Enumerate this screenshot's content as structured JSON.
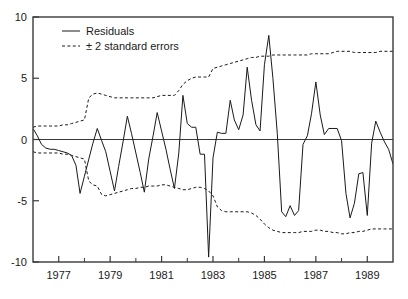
{
  "chart_data": {
    "type": "line",
    "title": "",
    "xlabel": "",
    "ylabel": "",
    "xlim": [
      1976.0,
      1990.0
    ],
    "ylim": [
      -10,
      10
    ],
    "grid": false,
    "legend_position": "top-left",
    "yticks": [
      10,
      5,
      0,
      -5,
      -10
    ],
    "ytick_labels": [
      "10",
      "5",
      "0",
      "-5",
      "-10"
    ],
    "xticks": [
      1977,
      1979,
      1981,
      1983,
      1985,
      1987,
      1989
    ],
    "xtick_labels": [
      "1977",
      "1979",
      "1981",
      "1983",
      "1985",
      "1987",
      "1989"
    ],
    "xminor_ticks": [
      1978,
      1980,
      1982,
      1984,
      1986,
      1988
    ],
    "zero_line": 0,
    "legend": [
      {
        "label": "Residuals",
        "style": "solid",
        "color": "#1a1a1a"
      },
      {
        "label": "± 2 standard errors",
        "style": "dashed",
        "color": "#1a1a1a"
      }
    ],
    "series": [
      {
        "name": "Residuals",
        "style": "solid",
        "color": "#1a1a1a",
        "x": [
          1976.0,
          1976.17,
          1976.33,
          1976.5,
          1976.67,
          1976.83,
          1977.0,
          1977.17,
          1977.33,
          1977.5,
          1977.67,
          1977.83,
          1978.0,
          1978.17,
          1978.33,
          1978.5,
          1978.67,
          1978.83,
          1979.0,
          1979.17,
          1979.33,
          1979.5,
          1979.67,
          1979.83,
          1980.0,
          1980.17,
          1980.33,
          1980.5,
          1980.67,
          1980.83,
          1981.0,
          1981.17,
          1981.33,
          1981.5,
          1981.67,
          1981.83,
          1982.0,
          1982.17,
          1982.33,
          1982.5,
          1982.67,
          1982.83,
          1983.0,
          1983.17,
          1983.33,
          1983.5,
          1983.67,
          1983.83,
          1984.0,
          1984.17,
          1984.33,
          1984.5,
          1984.67,
          1984.83,
          1985.0,
          1985.17,
          1985.33,
          1985.5,
          1985.67,
          1985.83,
          1986.0,
          1986.17,
          1986.33,
          1986.5,
          1986.67,
          1986.83,
          1987.0,
          1987.17,
          1987.33,
          1987.5,
          1987.67,
          1987.83,
          1988.0,
          1988.17,
          1988.33,
          1988.5,
          1988.67,
          1988.83,
          1989.0,
          1989.17,
          1989.33,
          1989.5,
          1989.67,
          1989.83,
          1990.0
        ],
        "values": [
          0.9,
          0.3,
          -0.4,
          -0.7,
          -0.8,
          -0.8,
          -0.9,
          -1.0,
          -1.1,
          -1.3,
          -2.1,
          -4.4,
          -3.0,
          -1.6,
          -0.3,
          0.9,
          -0.1,
          -1.0,
          -2.6,
          -4.2,
          -2.2,
          -0.2,
          1.9,
          0.5,
          -1.1,
          -2.7,
          -4.3,
          -1.6,
          0.3,
          2.2,
          0.7,
          -0.8,
          -2.4,
          -4.0,
          -1.1,
          3.6,
          1.3,
          1.0,
          1.0,
          -1.2,
          -1.2,
          -9.6,
          -1.5,
          0.6,
          0.5,
          0.5,
          3.2,
          1.6,
          0.8,
          2.0,
          5.9,
          3.2,
          1.2,
          0.7,
          6.1,
          8.5,
          5.0,
          0.5,
          -5.9,
          -6.3,
          -5.4,
          -6.2,
          -5.8,
          -0.4,
          0.3,
          2.1,
          4.7,
          2.0,
          0.4,
          0.9,
          0.9,
          0.9,
          -0.1,
          -4.4,
          -6.4,
          -5.2,
          -2.8,
          -2.7,
          -6.2,
          -0.3,
          1.5,
          0.6,
          -0.2,
          -0.8,
          -2.0
        ]
      },
      {
        "name": "+2 standard errors",
        "style": "dashed",
        "color": "#1a1a1a",
        "x": [
          1976.0,
          1976.17,
          1976.33,
          1976.5,
          1976.67,
          1976.83,
          1977.0,
          1977.17,
          1977.33,
          1977.5,
          1977.67,
          1977.83,
          1978.0,
          1978.17,
          1978.33,
          1978.5,
          1978.67,
          1978.83,
          1979.0,
          1979.17,
          1979.33,
          1979.5,
          1979.67,
          1979.83,
          1980.0,
          1980.17,
          1980.33,
          1980.5,
          1980.67,
          1980.83,
          1981.0,
          1981.17,
          1981.33,
          1981.5,
          1981.67,
          1981.83,
          1982.0,
          1982.17,
          1982.33,
          1982.5,
          1982.67,
          1982.83,
          1983.0,
          1983.17,
          1983.33,
          1983.5,
          1983.67,
          1983.83,
          1984.0,
          1984.17,
          1984.33,
          1984.5,
          1984.67,
          1984.83,
          1985.0,
          1985.17,
          1985.33,
          1985.5,
          1985.67,
          1985.83,
          1986.0,
          1986.17,
          1986.33,
          1986.5,
          1986.67,
          1986.83,
          1987.0,
          1987.17,
          1987.33,
          1987.5,
          1987.67,
          1987.83,
          1988.0,
          1988.17,
          1988.33,
          1988.5,
          1988.67,
          1988.83,
          1989.0,
          1989.17,
          1989.33,
          1989.5,
          1989.67,
          1989.83,
          1990.0
        ],
        "values": [
          1.0,
          1.1,
          1.1,
          1.1,
          1.1,
          1.1,
          1.1,
          1.2,
          1.2,
          1.3,
          1.4,
          1.5,
          1.6,
          3.4,
          3.7,
          3.8,
          3.7,
          3.6,
          3.5,
          3.4,
          3.4,
          3.4,
          3.4,
          3.4,
          3.4,
          3.4,
          3.4,
          3.4,
          3.4,
          3.5,
          3.6,
          3.6,
          3.6,
          3.6,
          4.0,
          4.5,
          4.8,
          5.0,
          5.1,
          5.1,
          5.1,
          5.1,
          5.8,
          5.9,
          6.0,
          6.1,
          6.2,
          6.3,
          6.4,
          6.5,
          6.6,
          6.7,
          6.7,
          6.8,
          6.8,
          6.8,
          6.9,
          6.9,
          6.9,
          6.9,
          6.9,
          6.9,
          6.9,
          6.9,
          6.9,
          7.0,
          7.0,
          7.0,
          7.0,
          7.0,
          7.1,
          7.2,
          7.2,
          7.2,
          7.2,
          7.1,
          7.1,
          7.1,
          7.1,
          7.1,
          7.1,
          7.2,
          7.2,
          7.2,
          7.2
        ]
      },
      {
        "name": "-2 standard errors",
        "style": "dashed",
        "color": "#1a1a1a",
        "x": [
          1976.0,
          1976.17,
          1976.33,
          1976.5,
          1976.67,
          1976.83,
          1977.0,
          1977.17,
          1977.33,
          1977.5,
          1977.67,
          1977.83,
          1978.0,
          1978.17,
          1978.33,
          1978.5,
          1978.67,
          1978.83,
          1979.0,
          1979.17,
          1979.33,
          1979.5,
          1979.67,
          1979.83,
          1980.0,
          1980.17,
          1980.33,
          1980.5,
          1980.67,
          1980.83,
          1981.0,
          1981.17,
          1981.33,
          1981.5,
          1981.67,
          1981.83,
          1982.0,
          1982.17,
          1982.33,
          1982.5,
          1982.67,
          1982.83,
          1983.0,
          1983.17,
          1983.33,
          1983.5,
          1983.67,
          1983.83,
          1984.0,
          1984.17,
          1984.33,
          1984.5,
          1984.67,
          1984.83,
          1985.0,
          1985.17,
          1985.33,
          1985.5,
          1985.67,
          1985.83,
          1986.0,
          1986.17,
          1986.33,
          1986.5,
          1986.67,
          1986.83,
          1987.0,
          1987.17,
          1987.33,
          1987.5,
          1987.67,
          1987.83,
          1988.0,
          1988.17,
          1988.33,
          1988.5,
          1988.67,
          1988.83,
          1989.0,
          1989.17,
          1989.33,
          1989.5,
          1989.67,
          1989.83,
          1990.0
        ],
        "values": [
          -1.0,
          -1.1,
          -1.1,
          -1.1,
          -1.1,
          -1.1,
          -1.1,
          -1.2,
          -1.2,
          -1.3,
          -1.4,
          -1.5,
          -1.6,
          -3.4,
          -3.7,
          -3.8,
          -4.5,
          -4.6,
          -4.5,
          -4.4,
          -4.3,
          -4.2,
          -4.1,
          -4.0,
          -4.0,
          -3.9,
          -3.9,
          -3.8,
          -3.8,
          -3.8,
          -3.7,
          -3.7,
          -3.8,
          -3.9,
          -4.0,
          -4.1,
          -4.1,
          -4.0,
          -3.9,
          -3.9,
          -4.0,
          -4.2,
          -4.6,
          -5.5,
          -5.8,
          -5.9,
          -5.9,
          -5.9,
          -5.9,
          -5.9,
          -5.9,
          -6.0,
          -6.2,
          -6.5,
          -6.9,
          -7.2,
          -7.4,
          -7.5,
          -7.6,
          -7.6,
          -7.6,
          -7.6,
          -7.6,
          -7.5,
          -7.5,
          -7.5,
          -7.4,
          -7.4,
          -7.5,
          -7.5,
          -7.6,
          -7.6,
          -7.7,
          -7.7,
          -7.6,
          -7.6,
          -7.5,
          -7.5,
          -7.4,
          -7.3,
          -7.3,
          -7.3,
          -7.3,
          -7.3,
          -7.3
        ]
      }
    ]
  }
}
